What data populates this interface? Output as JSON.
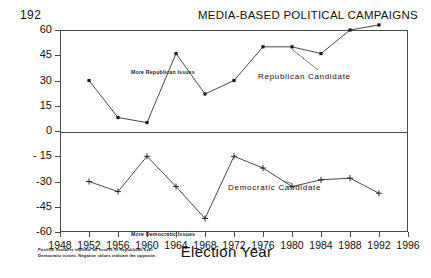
{
  "page": {
    "number": "192",
    "running_head": "MEDIA-BASED POLITICAL CAMPAIGNS"
  },
  "footnote": "Positive numbers indicate an excess of Republican over Democratic issues. Negative values indicate the opposite.",
  "annotations": {
    "top": "More Republican Issues",
    "bottom": "More Democratic Issues"
  },
  "chart_data": {
    "type": "line",
    "title": "",
    "xlabel": "Election Year",
    "ylabel": "",
    "xlim": [
      1948,
      1996
    ],
    "ylim": [
      -60,
      60
    ],
    "grid": false,
    "legend_position": "inline-annotation",
    "x": [
      1952,
      1956,
      1960,
      1964,
      1968,
      1972,
      1976,
      1980,
      1984,
      1988,
      1992
    ],
    "xticks": [
      1948,
      1952,
      1956,
      1960,
      1964,
      1968,
      1972,
      1976,
      1980,
      1984,
      1988,
      1992,
      1996
    ],
    "yticks": [
      60,
      45,
      30,
      15,
      0,
      -15,
      -30,
      -45,
      -60
    ],
    "ytick_labels": [
      "60",
      "45",
      "30",
      "15",
      "0",
      "- 15",
      "-30",
      "-45",
      "-60"
    ],
    "series": [
      {
        "name": "Republican Candidate",
        "marker": "square",
        "values": [
          30,
          8,
          5,
          46,
          22,
          30,
          50,
          50,
          46,
          60,
          63
        ]
      },
      {
        "name": "Democratic Candidate",
        "marker": "plus",
        "values": [
          -30,
          -36,
          -15,
          -33,
          -52,
          -15,
          -22,
          -33,
          -29,
          -28,
          -37
        ]
      }
    ]
  }
}
